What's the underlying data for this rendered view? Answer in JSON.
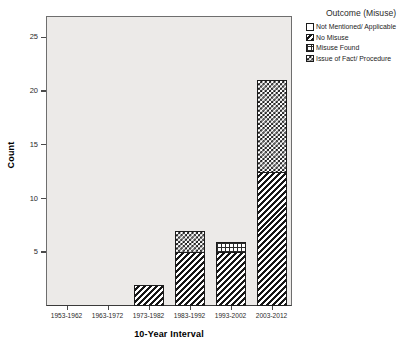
{
  "chart_data": {
    "type": "bar",
    "subtype": "stacked-bar",
    "title": "",
    "xlabel": "10-Year Interval",
    "ylabel": "Count",
    "ylim": [
      0,
      27
    ],
    "yticks": [
      5,
      10,
      15,
      20,
      25
    ],
    "grid": false,
    "legend_position": "top-right",
    "legend_title": "Outcome (Misuse)",
    "categories": [
      "1953-1962",
      "1963-1972",
      "1973-1982",
      "1983-1992",
      "1993-2002",
      "2003-2012"
    ],
    "series": [
      {
        "name": "Not Mentioned/ Applicable",
        "pattern": "blank",
        "values": [
          0,
          0,
          0,
          0,
          0,
          0
        ]
      },
      {
        "name": "No Misuse",
        "pattern": "diagonal",
        "values": [
          0,
          0,
          2,
          5,
          5,
          12.5
        ]
      },
      {
        "name": "Misuse Found",
        "pattern": "grid",
        "values": [
          0,
          0,
          0,
          0,
          1,
          0
        ]
      },
      {
        "name": "Issue of Fact/ Procedure",
        "pattern": "checker",
        "values": [
          0,
          0,
          0,
          2,
          0,
          8.5
        ]
      }
    ],
    "totals": [
      0,
      0,
      2,
      7,
      6,
      21
    ]
  },
  "axes": {
    "y": {
      "title": "Count",
      "ticks": [
        "5",
        "10",
        "15",
        "20",
        "25"
      ]
    },
    "x": {
      "title": "10-Year Interval",
      "ticks": [
        "1953-1962",
        "1963-1972",
        "1973-1982",
        "1983-1992",
        "1993-2002",
        "2003-2012"
      ]
    }
  },
  "legend": {
    "title": "Outcome (Misuse)",
    "items": [
      {
        "label": "Not Mentioned/ Applicable",
        "pattern": "blank"
      },
      {
        "label": "No Misuse",
        "pattern": "diagonal"
      },
      {
        "label": "Misuse Found",
        "pattern": "grid"
      },
      {
        "label": "Issue of Fact/ Procedure",
        "pattern": "checker"
      }
    ]
  },
  "colors": {
    "plot_background": "#eceae8",
    "page_background": "#ffffff",
    "axis_line": "#4a4a4a",
    "bar_outline": "#1c1c1c",
    "ink": "#161616"
  }
}
